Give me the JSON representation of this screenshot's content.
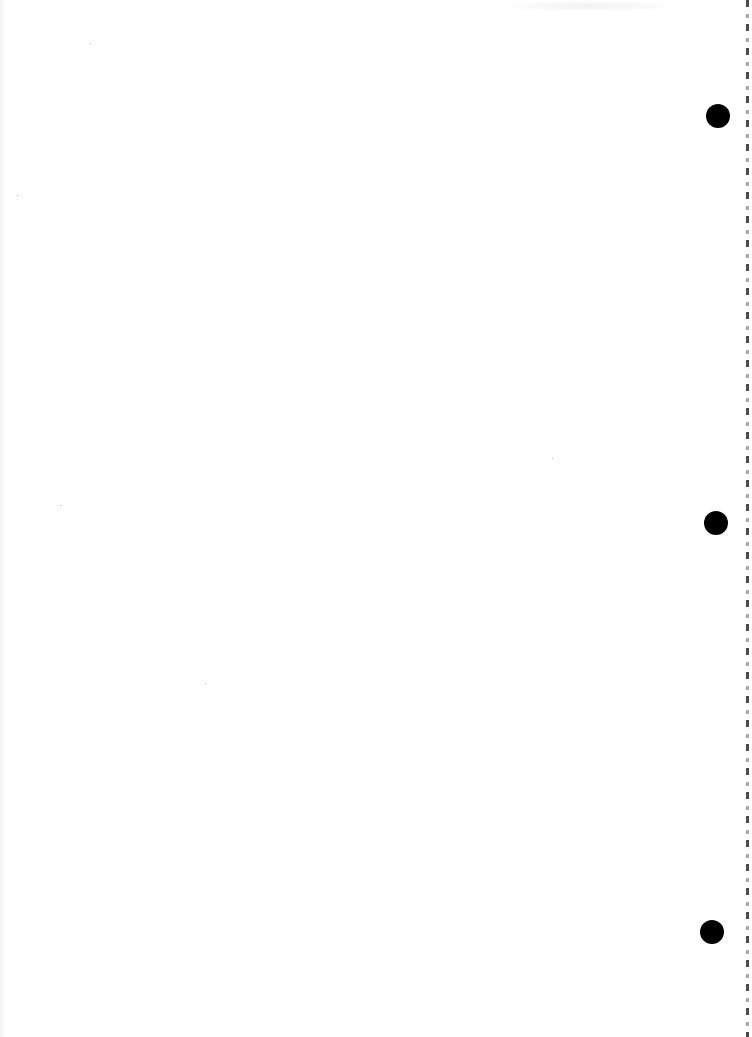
{
  "page": {
    "type": "scanned blank page",
    "background_color": "#ffffff",
    "text_content": ""
  },
  "binder_holes": [
    {
      "name": "hole-top",
      "cx": 718,
      "cy": 116,
      "diameter": 24,
      "color": "#000000"
    },
    {
      "name": "hole-middle",
      "cx": 716,
      "cy": 523,
      "diameter": 24,
      "color": "#000000"
    },
    {
      "name": "hole-bottom",
      "cx": 712,
      "cy": 932,
      "diameter": 24,
      "color": "#000000"
    }
  ],
  "edge": {
    "style": "dashed perforation",
    "color": "#2a2a2a"
  }
}
